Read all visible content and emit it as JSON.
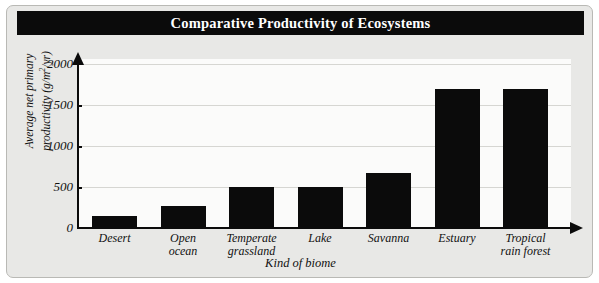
{
  "figure": {
    "title": "Comparative Productivity of Ecosystems",
    "background_color": "#e8e8e6",
    "plot_background_color": "#fbfbfa",
    "bar_color": "#0b0b0b",
    "axis_color": "#0b0b0b",
    "title_background_color": "#0b0b0b",
    "title_text_color": "#ffffff"
  },
  "axes": {
    "ylabel_line1": "Average net primary",
    "ylabel_line2_pre": "productivity (g/m",
    "ylabel_line2_sup": "2",
    "ylabel_line2_post": "/yr)",
    "xlabel": "Kind of biome",
    "yticks": [
      "2000",
      "1500",
      "1000",
      "500",
      "0"
    ]
  },
  "chart_data": {
    "type": "bar",
    "title": "Comparative Productivity of Ecosystems",
    "xlabel": "Kind of biome",
    "ylabel": "Average net primary productivity (g/m2/yr)",
    "categories": [
      "Desert",
      "Open ocean",
      "Temperate grassland",
      "Lake",
      "Savanna",
      "Estuary",
      "Tropical rain forest"
    ],
    "category_lines": [
      [
        "Desert"
      ],
      [
        "Open",
        "ocean"
      ],
      [
        "Temperate",
        "grassland"
      ],
      [
        "Lake"
      ],
      [
        "Savanna"
      ],
      [
        "Estuary"
      ],
      [
        "Tropical",
        "rain forest"
      ]
    ],
    "values": [
      150,
      270,
      500,
      500,
      670,
      1700,
      1700
    ],
    "ylim": [
      0,
      2000
    ],
    "yticks": [
      0,
      500,
      1000,
      1500,
      2000
    ],
    "grid": true,
    "legend": false
  }
}
